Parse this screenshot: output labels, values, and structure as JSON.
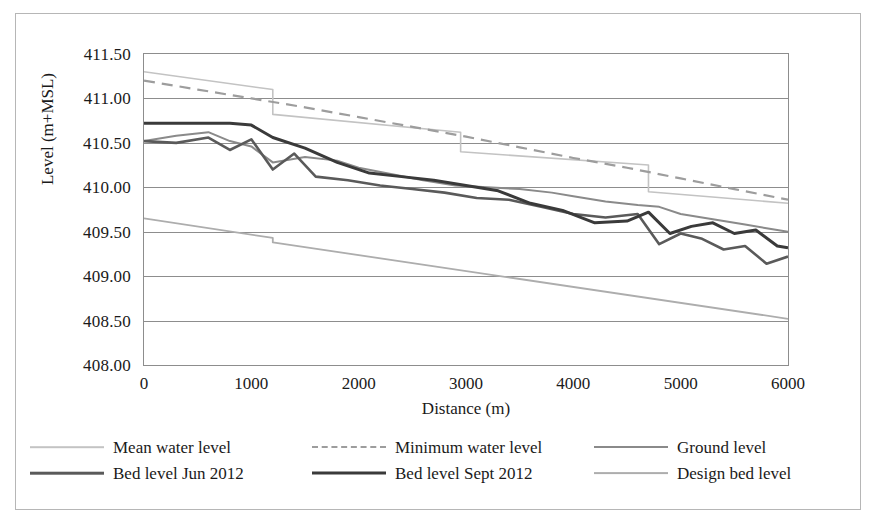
{
  "chart_data": {
    "type": "line",
    "title": "",
    "xlabel": "Distance (m)",
    "ylabel": "Level (m+MSL)",
    "xlim": [
      0,
      6000
    ],
    "ylim": [
      408.0,
      411.5
    ],
    "xticks": [
      "0",
      "1000",
      "2000",
      "3000",
      "4000",
      "5000",
      "6000"
    ],
    "yticks": [
      "411.50",
      "411.00",
      "410.50",
      "410.00",
      "409.50",
      "409.00",
      "408.50",
      "408.00"
    ],
    "grid": "horizontal",
    "legend_position": "bottom",
    "series": [
      {
        "name": "Mean water level",
        "color": "#c3c3c3",
        "width": 1.6,
        "dash": "none",
        "x": [
          0,
          1200,
          1200,
          2950,
          2950,
          4700,
          4700,
          6000
        ],
        "y": [
          411.3,
          411.1,
          410.82,
          410.62,
          410.4,
          410.25,
          409.95,
          409.82
        ]
      },
      {
        "name": "Minimum water level",
        "color": "#9d9d9d",
        "width": 2.2,
        "dash": "dashed",
        "x": [
          0,
          500,
          1000,
          1500,
          2000,
          2500,
          3000,
          3500,
          4000,
          4500,
          5000,
          5500,
          6000
        ],
        "y": [
          411.2,
          411.1,
          411.0,
          410.9,
          410.79,
          410.68,
          410.57,
          410.45,
          410.33,
          410.22,
          410.1,
          409.98,
          409.86
        ]
      },
      {
        "name": "Ground level",
        "color": "#8a8a8a",
        "width": 2.0,
        "dash": "none",
        "x": [
          0,
          300,
          600,
          800,
          1000,
          1200,
          1500,
          1800,
          2000,
          2300,
          2600,
          2900,
          3200,
          3500,
          3800,
          4000,
          4300,
          4600,
          4800,
          5000,
          5300,
          5600,
          5800,
          6000
        ],
        "y": [
          410.52,
          410.58,
          410.62,
          410.52,
          410.46,
          410.28,
          410.34,
          410.3,
          410.22,
          410.15,
          410.08,
          410.02,
          410.0,
          409.98,
          409.94,
          409.9,
          409.84,
          409.8,
          409.78,
          409.7,
          409.64,
          409.58,
          409.54,
          409.5
        ]
      },
      {
        "name": "Bed level Jun 2012",
        "color": "#5a5a5a",
        "width": 2.6,
        "dash": "none",
        "x": [
          0,
          300,
          600,
          800,
          1000,
          1200,
          1400,
          1600,
          1900,
          2200,
          2500,
          2800,
          3100,
          3400,
          3700,
          4000,
          4300,
          4600,
          4800,
          5000,
          5200,
          5400,
          5600,
          5800,
          6000
        ],
        "y": [
          410.52,
          410.5,
          410.56,
          410.42,
          410.54,
          410.2,
          410.38,
          410.12,
          410.08,
          410.02,
          409.98,
          409.94,
          409.88,
          409.86,
          409.78,
          409.7,
          409.66,
          409.7,
          409.36,
          409.48,
          409.42,
          409.3,
          409.34,
          409.14,
          409.22
        ]
      },
      {
        "name": "Bed level Sept 2012",
        "color": "#3a3a3a",
        "width": 3.0,
        "dash": "none",
        "x": [
          0,
          400,
          800,
          1000,
          1200,
          1500,
          1800,
          2100,
          2400,
          2700,
          3000,
          3300,
          3600,
          3900,
          4200,
          4500,
          4700,
          4900,
          5100,
          5300,
          5500,
          5700,
          5900,
          6000
        ],
        "y": [
          410.72,
          410.72,
          410.72,
          410.7,
          410.56,
          410.44,
          410.28,
          410.16,
          410.12,
          410.08,
          410.02,
          409.96,
          409.82,
          409.74,
          409.6,
          409.62,
          409.72,
          409.48,
          409.56,
          409.6,
          409.48,
          409.52,
          409.34,
          409.32
        ]
      },
      {
        "name": "Design bed level",
        "color": "#adadad",
        "width": 1.8,
        "dash": "none",
        "x": [
          0,
          1200,
          1200,
          6000
        ],
        "y": [
          409.65,
          409.43,
          409.38,
          408.52
        ]
      }
    ]
  },
  "legend": {
    "rows": [
      [
        {
          "label": "Mean water level",
          "key": "mean-water-level"
        },
        {
          "label": "Minimum water level",
          "key": "minimum-water-level"
        },
        {
          "label": "Ground level",
          "key": "ground-level"
        }
      ],
      [
        {
          "label": "Bed level Jun 2012",
          "key": "bed-level-jun-2012"
        },
        {
          "label": "Bed level Sept 2012",
          "key": "bed-level-sept-2012"
        },
        {
          "label": "Design bed level",
          "key": "design-bed-level"
        }
      ]
    ]
  }
}
